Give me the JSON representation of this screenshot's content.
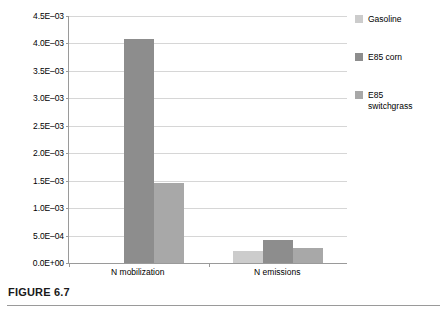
{
  "figure": {
    "caption": "FIGURE 6.7"
  },
  "chart_data": {
    "type": "bar",
    "title": "",
    "xlabel": "",
    "ylabel": "",
    "categories": [
      "N mobilization",
      "N emissions"
    ],
    "series": [
      {
        "name": "Gasoline",
        "color": "#cccccc",
        "values": [
          0.0,
          0.00022
        ]
      },
      {
        "name": "E85 corn",
        "color": "#8d8d8d",
        "values": [
          0.00408,
          0.00042
        ]
      },
      {
        "name": "E85\nswitchgrass",
        "color": "#a8a8a8",
        "values": [
          0.00145,
          0.00027
        ]
      }
    ],
    "legend": [
      {
        "label": "Gasoline",
        "color": "#cccccc"
      },
      {
        "label": "E85 corn",
        "color": "#8d8d8d"
      },
      {
        "label": "E85\nswitchgrass",
        "color": "#a8a8a8"
      }
    ],
    "ylim": [
      0.0,
      0.0045
    ],
    "ytick_values": [
      0.0,
      0.0005,
      0.001,
      0.0015,
      0.002,
      0.0025,
      0.003,
      0.0035,
      0.004,
      0.0045
    ],
    "ytick_labels": [
      "0.0E+00",
      "5.0E–04",
      "1.0E–03",
      "1.5E–03",
      "2.0E–03",
      "2.5E–03",
      "3.0E–03",
      "3.5E–03",
      "4.0E–03",
      "4.5E–03"
    ],
    "grid": true,
    "legend_position": "right"
  }
}
